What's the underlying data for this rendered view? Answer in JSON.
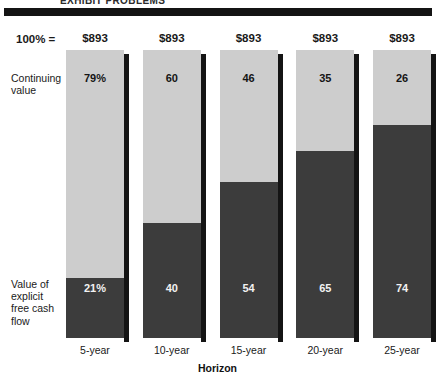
{
  "header": {
    "title": "EXHIBIT PROBLEMS"
  },
  "axis_note": {
    "total_label": "100%  ="
  },
  "legend": {
    "top": "Continuing\nvalue",
    "top_line1": "Continuing",
    "top_line2": "value",
    "bottom_line1": "Value of",
    "bottom_line2": "explicit",
    "bottom_line3": "free cash",
    "bottom_line4": "flow"
  },
  "colors": {
    "continuing_value": "#cdcdcd",
    "explicit_free_cash_flow": "#3c3c3c",
    "rule": "#141414",
    "text": "#1a1a1a"
  },
  "chart_data": {
    "type": "bar",
    "title": "EXHIBIT PROBLEMS",
    "xlabel": "Horizon",
    "ylabel": "",
    "ylim": [
      0,
      100
    ],
    "grid": false,
    "legend_position": "left-side-labels",
    "stacked": true,
    "categories": [
      "5-year",
      "10-year",
      "15-year",
      "20-year",
      "25-year"
    ],
    "totals": [
      "$893",
      "$893",
      "$893",
      "$893",
      "$893"
    ],
    "series": [
      {
        "name": "Continuing value",
        "color": "#cdcdcd",
        "values": [
          79,
          60,
          46,
          35,
          26
        ],
        "labels": [
          "79%",
          "60",
          "46",
          "35",
          "26"
        ]
      },
      {
        "name": "Value of explicit free cash flow",
        "color": "#3c3c3c",
        "values": [
          21,
          40,
          54,
          65,
          74
        ],
        "labels": [
          "21%",
          "40",
          "54",
          "65",
          "74"
        ]
      }
    ]
  }
}
